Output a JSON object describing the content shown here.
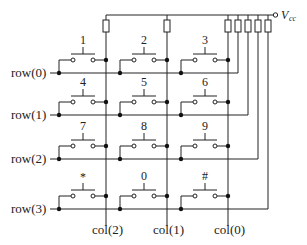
{
  "diagram": {
    "type": "keypad-matrix-schematic",
    "supply": {
      "label": "V",
      "subscript": "cc"
    },
    "rows": [
      {
        "label": "row(0)"
      },
      {
        "label": "row(1)"
      },
      {
        "label": "row(2)"
      },
      {
        "label": "row(3)"
      }
    ],
    "cols": [
      {
        "label": "col(2)"
      },
      {
        "label": "col(1)"
      },
      {
        "label": "col(0)"
      }
    ],
    "keys": [
      [
        "1",
        "2",
        "3"
      ],
      [
        "4",
        "5",
        "6"
      ],
      [
        "7",
        "8",
        "9"
      ],
      [
        "*",
        "0",
        "#"
      ]
    ],
    "pullup_resistor_count": 7
  }
}
